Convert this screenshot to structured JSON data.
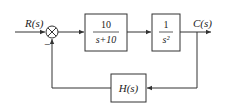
{
  "diagram": {
    "type": "block-diagram",
    "input_label": "R(s)",
    "output_label": "C(s)",
    "summing_junction": {
      "feedback_sign": "−"
    },
    "blocks": [
      {
        "id": "G1",
        "numerator": "10",
        "denominator": "s+10"
      },
      {
        "id": "G2",
        "numerator": "1",
        "denominator": "s²"
      },
      {
        "id": "H",
        "label": "H(s)"
      }
    ],
    "colors": {
      "line": "#333333",
      "background": "#ffffff"
    }
  }
}
